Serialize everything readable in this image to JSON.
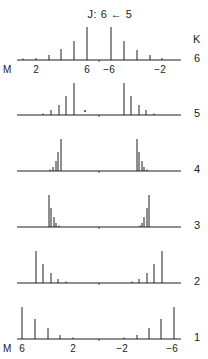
{
  "chart_data": {
    "type": "stick",
    "title": "J: 6 ← 5",
    "xlabel": "M",
    "right_label": "K",
    "axis": {
      "x_start": 17,
      "x_end": 181,
      "center_x": 99
    },
    "panels": [
      {
        "K": "6",
        "baseline_y": 60,
        "sticks": [
          {
            "M": 1,
            "x": 23,
            "h": 0
          },
          {
            "M": 2,
            "x": 36,
            "h": 2
          },
          {
            "M": 3,
            "x": 49,
            "h": 5
          },
          {
            "M": 4,
            "x": 61,
            "h": 11
          },
          {
            "M": 5,
            "x": 74,
            "h": 19
          },
          {
            "M": 6,
            "x": 87,
            "h": 33
          },
          {
            "M": -6,
            "x": 111,
            "h": 33
          },
          {
            "M": -5,
            "x": 124,
            "h": 19
          },
          {
            "M": -4,
            "x": 137,
            "h": 10
          },
          {
            "M": -3,
            "x": 150,
            "h": 5
          },
          {
            "M": -2,
            "x": 162,
            "h": 2
          }
        ],
        "tick_labels": [
          {
            "text": "2",
            "x": 36
          },
          {
            "text": "6",
            "x": 87
          },
          {
            "text": "-6",
            "x": 111
          },
          {
            "text": "-2",
            "x": 162
          }
        ]
      },
      {
        "K": "5",
        "baseline_y": 115,
        "sticks": [
          {
            "M": 2,
            "x": 43,
            "h": 1
          },
          {
            "M": 3,
            "x": 51,
            "h": 5
          },
          {
            "M": 4,
            "x": 59,
            "h": 10
          },
          {
            "M": 5,
            "x": 66,
            "h": 19
          },
          {
            "M": 6,
            "x": 74,
            "h": 32
          },
          {
            "M": -6,
            "x": 124,
            "h": 32
          },
          {
            "M": -5,
            "x": 131,
            "h": 19
          },
          {
            "M": -4,
            "x": 139,
            "h": 10
          },
          {
            "M": -3,
            "x": 146,
            "h": 5
          },
          {
            "M": -2,
            "x": 154,
            "h": 1
          }
        ],
        "dot": {
          "x": 85,
          "y": 111
        }
      },
      {
        "K": "4",
        "baseline_y": 171,
        "sticks": [
          {
            "M": 2,
            "x": 50,
            "h": 1
          },
          {
            "M": 3,
            "x": 53,
            "h": 4
          },
          {
            "M": 4,
            "x": 56,
            "h": 10
          },
          {
            "M": 5,
            "x": 58,
            "h": 19
          },
          {
            "M": 6,
            "x": 61,
            "h": 32
          },
          {
            "M": -6,
            "x": 137,
            "h": 32
          },
          {
            "M": -5,
            "x": 139,
            "h": 19
          },
          {
            "M": -4,
            "x": 142,
            "h": 10
          },
          {
            "M": -3,
            "x": 144,
            "h": 4
          },
          {
            "M": -2,
            "x": 147,
            "h": 1
          }
        ]
      },
      {
        "K": "3",
        "baseline_y": 227,
        "sticks": [
          {
            "M": 6,
            "x": 49,
            "h": 32
          },
          {
            "M": 5,
            "x": 51,
            "h": 19
          },
          {
            "M": 4,
            "x": 54,
            "h": 10
          },
          {
            "M": 3,
            "x": 56,
            "h": 4
          },
          {
            "M": 2,
            "x": 59,
            "h": 1
          },
          {
            "M": -2,
            "x": 140,
            "h": 1
          },
          {
            "M": -3,
            "x": 142,
            "h": 4
          },
          {
            "M": -4,
            "x": 144,
            "h": 10
          },
          {
            "M": -5,
            "x": 147,
            "h": 19
          },
          {
            "M": -6,
            "x": 149,
            "h": 32
          }
        ]
      },
      {
        "K": "2",
        "baseline_y": 283,
        "sticks": [
          {
            "M": 6,
            "x": 36,
            "h": 32
          },
          {
            "M": 5,
            "x": 43,
            "h": 19
          },
          {
            "M": 4,
            "x": 51,
            "h": 10
          },
          {
            "M": 3,
            "x": 58,
            "h": 4
          },
          {
            "M": 2,
            "x": 66,
            "h": 1
          },
          {
            "M": -2,
            "x": 132,
            "h": 1
          },
          {
            "M": -3,
            "x": 139,
            "h": 4
          },
          {
            "M": -4,
            "x": 147,
            "h": 10
          },
          {
            "M": -5,
            "x": 154,
            "h": 19
          },
          {
            "M": -6,
            "x": 162,
            "h": 32
          }
        ]
      },
      {
        "K": "1",
        "baseline_y": 339,
        "sticks": [
          {
            "M": 6,
            "x": 22,
            "h": 32
          },
          {
            "M": 5,
            "x": 35,
            "h": 20
          },
          {
            "M": 4,
            "x": 48,
            "h": 11
          },
          {
            "M": 3,
            "x": 60,
            "h": 4
          },
          {
            "M": 2,
            "x": 73,
            "h": 1
          },
          {
            "M": -2,
            "x": 124,
            "h": 1
          },
          {
            "M": -3,
            "x": 137,
            "h": 4
          },
          {
            "M": -4,
            "x": 149,
            "h": 11
          },
          {
            "M": -5,
            "x": 161,
            "h": 20
          },
          {
            "M": -6,
            "x": 174,
            "h": 32
          }
        ],
        "tick_labels": [
          {
            "text": "6",
            "x": 22
          },
          {
            "text": "2",
            "x": 73
          },
          {
            "text": "-2",
            "x": 124
          },
          {
            "text": "-6",
            "x": 174
          }
        ]
      }
    ]
  },
  "labels": {
    "title": "J: 6 ← 5",
    "k_header": "K",
    "m_axis": "M",
    "k_values": [
      "6",
      "5",
      "4",
      "3",
      "2",
      "1"
    ]
  }
}
